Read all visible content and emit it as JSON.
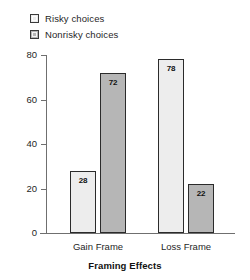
{
  "chart_data": {
    "type": "bar",
    "title": "",
    "subtitle": "",
    "xlabel": "Framing Effects",
    "ylabel": "",
    "categories": [
      "Gain Frame",
      "Loss Frame"
    ],
    "series": [
      {
        "name": "Risky choices",
        "values": [
          28,
          72
        ],
        "color": "#ededed"
      },
      {
        "name": "Nonrisky choices",
        "values": [
          78,
          22
        ],
        "color": "#b6b6b6"
      }
    ],
    "bars": [
      {
        "group": "Gain Frame",
        "series": "Risky choices",
        "value": 28,
        "label": "28"
      },
      {
        "group": "Gain Frame",
        "series": "Nonrisky choices",
        "value": 72,
        "label": "72"
      },
      {
        "group": "Loss Frame",
        "series": "Risky choices",
        "value": 78,
        "label": "78"
      },
      {
        "group": "Loss Frame",
        "series": "Nonrisky choices",
        "value": 22,
        "label": "22"
      }
    ],
    "ylim": [
      0,
      80
    ],
    "yticks": [
      0,
      20,
      40,
      60,
      80
    ],
    "ytick_labels": [
      "0",
      "20",
      "40",
      "60",
      "80"
    ],
    "grid": false,
    "legend_position": "top-left",
    "data_labels": true
  },
  "legend": {
    "items": [
      {
        "label": "Risky choices",
        "color": "#ededed"
      },
      {
        "label": "Nonrisky choices",
        "color": "#b6b6b6"
      }
    ]
  },
  "axes": {
    "y": {
      "ticks": [
        {
          "label": "80",
          "value": 80
        },
        {
          "label": "60",
          "value": 60
        },
        {
          "label": "40",
          "value": 40
        },
        {
          "label": "20",
          "value": 20
        },
        {
          "label": "0",
          "value": 0
        }
      ]
    },
    "x": {
      "categories": [
        {
          "label": "Gain Frame"
        },
        {
          "label": "Loss Frame"
        }
      ],
      "title": "Framing Effects"
    }
  }
}
